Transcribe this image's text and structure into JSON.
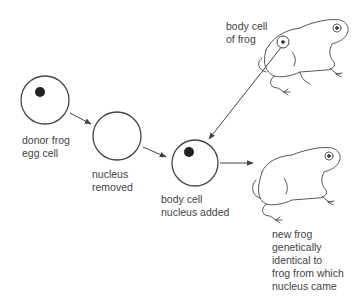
{
  "labels": {
    "donor_egg": "donor frog\negg cell",
    "nucleus_removed": "nucleus\nremoved",
    "nucleus_added": "body cell\nnucleus added",
    "body_cell": "body cell\nof frog",
    "new_frog": "new frog\ngenetically\nidentical to\nfrog from which\nnucleus came"
  },
  "steps": [
    {
      "id": "donor-egg",
      "has_nucleus": true
    },
    {
      "id": "enucleated-egg",
      "has_nucleus": false
    },
    {
      "id": "reconstructed-egg",
      "has_nucleus": true
    }
  ],
  "colors": {
    "line": "#444444",
    "nucleus": "#222222",
    "background": "#ffffff"
  }
}
